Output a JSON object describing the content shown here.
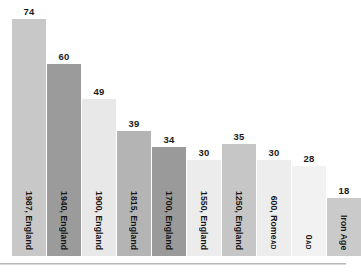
{
  "chart_data": {
    "type": "bar",
    "title": "",
    "subtitle": "",
    "xlabel": "",
    "ylabel": "",
    "ylim": [
      0,
      80
    ],
    "grid": false,
    "legend": null,
    "categories": [
      "1987, England",
      "1940, England",
      "1900, England",
      "1815, England",
      "1700, England",
      "1550, England",
      "1250, England",
      "AD 600, Rome",
      "AD 0",
      "Iron Age"
    ],
    "values": [
      74,
      60,
      49,
      39,
      34,
      30,
      35,
      30,
      28,
      18
    ],
    "value_labels": [
      "74",
      "60",
      "49",
      "39",
      "34",
      "30",
      "35",
      "30",
      "28",
      "18"
    ],
    "bars": [
      {
        "label_main": "1987, England",
        "label_era": "",
        "value": 74,
        "value_label": "74",
        "color": "#c8c8c8"
      },
      {
        "label_main": "1940, England",
        "label_era": "",
        "value": 60,
        "value_label": "60",
        "color": "#9b9b9b"
      },
      {
        "label_main": "1900, England",
        "label_era": "",
        "value": 49,
        "value_label": "49",
        "color": "#e8e8e8"
      },
      {
        "label_main": "1815, England",
        "label_era": "",
        "value": 39,
        "value_label": "39",
        "color": "#b4b4b4"
      },
      {
        "label_main": "1700, England",
        "label_era": "",
        "value": 34,
        "value_label": "34",
        "color": "#9a9a9a"
      },
      {
        "label_main": "1550, England",
        "label_era": "",
        "value": 30,
        "value_label": "30",
        "color": "#ececec"
      },
      {
        "label_main": "1250, England",
        "label_era": "",
        "value": 35,
        "value_label": "35",
        "color": "#c6c6c6"
      },
      {
        "label_main": "600, Rome",
        "label_era": "AD ",
        "value": 30,
        "value_label": "30",
        "color": "#ededed"
      },
      {
        "label_main": "0",
        "label_era": "AD ",
        "value": 28,
        "value_label": "28",
        "color": "#f2f2f2"
      },
      {
        "label_main": "Iron Age",
        "label_era": "",
        "value": 18,
        "value_label": "18",
        "color": "#cacaca"
      }
    ]
  }
}
